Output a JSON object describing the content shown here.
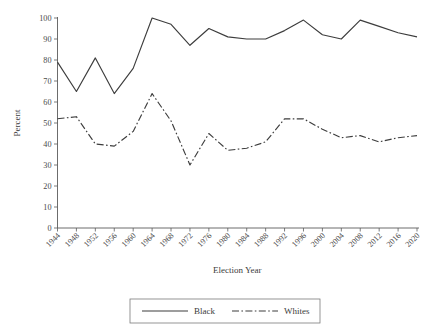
{
  "chart_data": {
    "type": "line",
    "title": "",
    "xlabel": "Election Year",
    "ylabel": "Percent",
    "ylim": [
      0,
      100
    ],
    "yticks": [
      0,
      10,
      20,
      30,
      40,
      50,
      60,
      70,
      80,
      90,
      100
    ],
    "grid": false,
    "legend_position": "bottom-center",
    "categories": [
      "1944",
      "1948",
      "1952",
      "1956",
      "1960",
      "1964",
      "1968",
      "1972",
      "1976",
      "1980",
      "1984",
      "1988",
      "1992",
      "1996",
      "2000",
      "2004",
      "2008",
      "2012",
      "2016",
      "2020"
    ],
    "series": [
      {
        "name": "Black",
        "style": "solid",
        "values": [
          79,
          65,
          81,
          64,
          76,
          100,
          97,
          87,
          95,
          91,
          90,
          90,
          94,
          99,
          92,
          90,
          99,
          96,
          93,
          91
        ]
      },
      {
        "name": "Whites",
        "style": "dash-dot",
        "values": [
          52,
          53,
          40,
          39,
          46,
          64,
          51,
          30,
          45,
          37,
          38,
          41,
          52,
          52,
          47,
          43,
          44,
          41,
          43,
          44
        ]
      }
    ]
  },
  "legend": {
    "entries": [
      {
        "label": "Black"
      },
      {
        "label": "Whites"
      }
    ]
  }
}
